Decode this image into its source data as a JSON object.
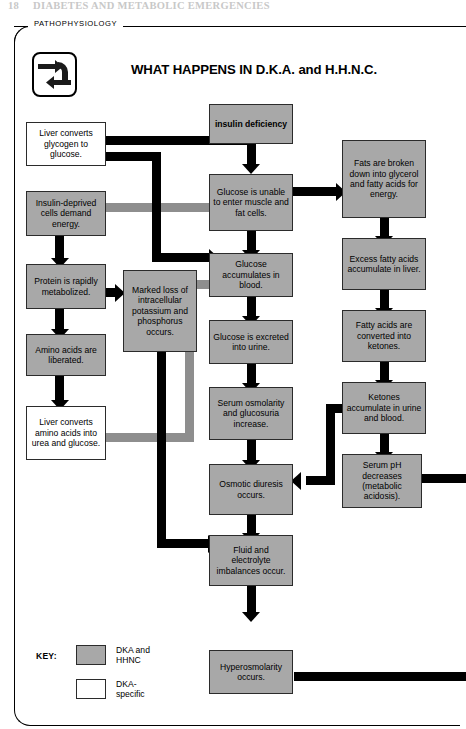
{
  "page": {
    "running_head_number": "18",
    "running_head_title": "DIABETES AND METABOLIC EMERGENCIES",
    "section_tab": "PATHOPHYSIOLOGY",
    "title": "WHAT HAPPENS IN D.K.A. and H.H.N.C.",
    "logo_icon": "cycle-arrows-icon"
  },
  "colors": {
    "node_shared_fill": "#a8a8a8",
    "node_dka_fill": "#ffffff",
    "connector_shared": "#000000",
    "connector_dka": "#8e8e8e",
    "border": "#2b2b2b"
  },
  "nodes": {
    "insulin_deficiency": "insulin\ndeficiency",
    "liver_glycogen": "Liver converts glycogen to glucose.",
    "insulin_deprived": "Insulin-deprived cells demand energy.",
    "protein_metabolized": "Protein is rapidly metabolized.",
    "amino_liberated": "Amino acids are liberated.",
    "liver_amino": "Liver converts amino acids into urea and glucose.",
    "marked_loss": "Marked loss of intracellular potassium and phosphorus occurs.",
    "glucose_unable": "Glucose is unable to enter muscle and fat cells.",
    "glucose_accumulates": "Glucose accumulates in blood.",
    "glucose_excreted": "Glucose is excreted into urine.",
    "serum_osmolarity": "Serum osmolarity and glucosuria increase.",
    "osmotic_diuresis": "Osmotic diuresis occurs.",
    "fluid_electrolyte": "Fluid and electrolyte imbalances occur.",
    "hyperosmolarity": "Hyperosmolarity occurs.",
    "fats_broken": "Fats are broken down into glycerol and fatty acids for energy.",
    "excess_fatty": "Excess fatty acids accumulate in liver.",
    "fatty_converted": "Fatty acids are converted into ketones.",
    "ketones_accumulate": "Ketones accumulate in urine and blood.",
    "serum_ph": "Serum pH decreases (metabolic acidosis)."
  },
  "key": {
    "label": "KEY:",
    "items": [
      {
        "swatch": "gray",
        "text": "DKA and\nHHNC"
      },
      {
        "swatch": "white",
        "text": "DKA-\nspecific"
      }
    ]
  },
  "diagram": {
    "type": "flowchart",
    "edges": [
      {
        "from": "insulin_deficiency",
        "to": "liver_glycogen",
        "color": "black"
      },
      {
        "from": "insulin_deficiency",
        "to": "glucose_unable",
        "color": "black"
      },
      {
        "from": "glucose_unable",
        "to": "insulin_deprived",
        "color": "gray"
      },
      {
        "from": "glucose_unable",
        "to": "fats_broken",
        "color": "black"
      },
      {
        "from": "glucose_unable",
        "to": "glucose_accumulates",
        "color": "black"
      },
      {
        "from": "liver_glycogen",
        "to": "glucose_accumulates",
        "color": "black"
      },
      {
        "from": "insulin_deprived",
        "to": "protein_metabolized",
        "color": "black"
      },
      {
        "from": "protein_metabolized",
        "to": "marked_loss",
        "color": "black"
      },
      {
        "from": "protein_metabolized",
        "to": "amino_liberated",
        "color": "black"
      },
      {
        "from": "amino_liberated",
        "to": "liver_amino",
        "color": "black"
      },
      {
        "from": "liver_amino",
        "to": "glucose_accumulates",
        "color": "gray"
      },
      {
        "from": "marked_loss",
        "to": "fluid_electrolyte",
        "color": "black"
      },
      {
        "from": "glucose_accumulates",
        "to": "glucose_excreted",
        "color": "black"
      },
      {
        "from": "glucose_excreted",
        "to": "serum_osmolarity",
        "color": "black"
      },
      {
        "from": "serum_osmolarity",
        "to": "osmotic_diuresis",
        "color": "black"
      },
      {
        "from": "osmotic_diuresis",
        "to": "fluid_electrolyte",
        "color": "black"
      },
      {
        "from": "fluid_electrolyte",
        "to": "hyperosmolarity",
        "color": "black"
      },
      {
        "from": "fats_broken",
        "to": "excess_fatty",
        "color": "black"
      },
      {
        "from": "excess_fatty",
        "to": "fatty_converted",
        "color": "black"
      },
      {
        "from": "fatty_converted",
        "to": "ketones_accumulate",
        "color": "black"
      },
      {
        "from": "ketones_accumulate",
        "to": "osmotic_diuresis",
        "color": "black"
      },
      {
        "from": "ketones_accumulate",
        "to": "serum_ph",
        "color": "black"
      },
      {
        "from": "serum_ph",
        "to": "offpage_right",
        "color": "black"
      },
      {
        "from": "hyperosmolarity",
        "to": "offpage_right",
        "color": "black"
      }
    ]
  }
}
